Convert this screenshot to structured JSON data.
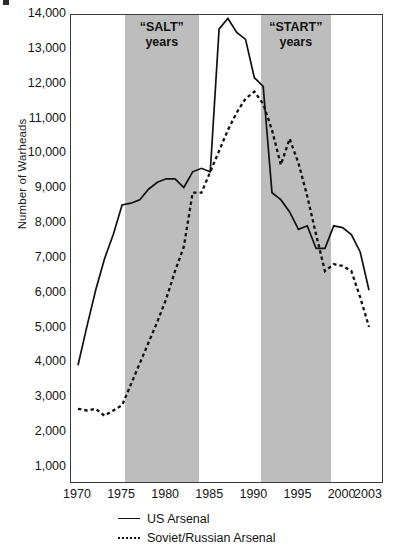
{
  "figure": {
    "corner_mark": "artifact-mark"
  },
  "chart_data": {
    "type": "line",
    "title": "",
    "xlabel": "",
    "ylabel": "Number of Warheads",
    "xlim": [
      1970,
      2004
    ],
    "ylim": [
      0,
      14000
    ],
    "grid": false,
    "legend_position": "bottom",
    "x_ticks": [
      1970,
      1975,
      1980,
      1985,
      1990,
      1995,
      2000,
      2003
    ],
    "x_tick_labels": [
      "1970",
      "1975",
      "1980",
      "1985",
      "1990",
      "1995",
      "2000",
      "2003"
    ],
    "y_ticks": [
      1000,
      2000,
      3000,
      4000,
      5000,
      6000,
      7000,
      8000,
      9000,
      10000,
      11000,
      12000,
      13000,
      14000
    ],
    "y_tick_labels": [
      "1,000",
      "2,000",
      "3,000",
      "4,000",
      "5,000",
      "6,000",
      "7,000",
      "8,000",
      "9,000",
      "10,000",
      "11,000",
      "12,000",
      "13,000",
      "14,000"
    ],
    "shaded_regions": [
      {
        "name": "salt",
        "label_line1": "“SALT”",
        "label_line2": "years",
        "x_start": 1975.3,
        "x_end": 1983.7,
        "color": "#bdbdbd"
      },
      {
        "name": "start",
        "label_line1": "“START”",
        "label_line2": "years",
        "x_start": 1990.7,
        "x_end": 1998.7,
        "color": "#bdbdbd"
      }
    ],
    "series": [
      {
        "name": "US Arsenal",
        "style": "solid",
        "color": "#111111",
        "x": [
          1970,
          1971,
          1972,
          1973,
          1974,
          1975,
          1976,
          1977,
          1978,
          1979,
          1980,
          1981,
          1982,
          1983,
          1984,
          1985,
          1986,
          1987,
          1988,
          1989,
          1990,
          1991,
          1992,
          1993,
          1994,
          1995,
          1996,
          1997,
          1998,
          1999,
          2000,
          2001,
          2002,
          2003
        ],
        "values": [
          3950,
          5050,
          6100,
          7000,
          7700,
          8550,
          8600,
          8700,
          9000,
          9200,
          9300,
          9300,
          9050,
          9500,
          9600,
          9500,
          13600,
          13900,
          13500,
          13300,
          12200,
          11950,
          8900,
          8700,
          8350,
          7850,
          7950,
          7300,
          7300,
          7950,
          7900,
          7700,
          7200,
          6100
        ]
      },
      {
        "name": "Soviet/Russian Arsenal",
        "style": "dotted",
        "color": "#111111",
        "x": [
          1970,
          1971,
          1972,
          1973,
          1974,
          1975,
          1976,
          1977,
          1978,
          1979,
          1980,
          1981,
          1982,
          1983,
          1984,
          1985,
          1986,
          1987,
          1988,
          1989,
          1990,
          1991,
          1992,
          1993,
          1994,
          1995,
          1996,
          1997,
          1998,
          1999,
          2000,
          2001,
          2002,
          2003
        ],
        "values": [
          2700,
          2650,
          2700,
          2500,
          2650,
          2800,
          3400,
          4000,
          4600,
          5200,
          5850,
          6650,
          7350,
          8900,
          8900,
          9500,
          10100,
          10700,
          11200,
          11600,
          11800,
          11450,
          10700,
          9700,
          10450,
          9750,
          8800,
          7700,
          6650,
          6850,
          6800,
          6650,
          5900,
          5050
        ]
      }
    ]
  },
  "axes": {
    "y_title": "Number of Warheads"
  },
  "legend": {
    "items": [
      {
        "label": "US Arsenal",
        "style": "solid"
      },
      {
        "label": "Soviet/Russian Arsenal",
        "style": "dotted"
      }
    ]
  }
}
